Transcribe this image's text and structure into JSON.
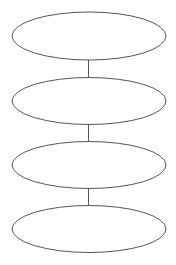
{
  "diagram": {
    "type": "vertical-chain",
    "stroke_color": "#555555",
    "fill_color": "#ffffff",
    "background": "#ffffff",
    "nodes": [
      {
        "id": "node-1",
        "label": "",
        "cx": 89,
        "cy": 36,
        "rx": 77,
        "ry": 24
      },
      {
        "id": "node-2",
        "label": "",
        "cx": 89,
        "cy": 101,
        "rx": 77,
        "ry": 23.5
      },
      {
        "id": "node-3",
        "label": "",
        "cx": 89,
        "cy": 165,
        "rx": 77,
        "ry": 23.5
      },
      {
        "id": "node-4",
        "label": "",
        "cx": 89,
        "cy": 229,
        "rx": 77,
        "ry": 23.5
      }
    ],
    "edges": [
      {
        "from": "node-1",
        "to": "node-2",
        "x": 88.5,
        "y1": 60,
        "y2": 77.5
      },
      {
        "from": "node-2",
        "to": "node-3",
        "x": 88.5,
        "y1": 124.5,
        "y2": 141.5
      },
      {
        "from": "node-3",
        "to": "node-4",
        "x": 88.5,
        "y1": 188.5,
        "y2": 205.5
      }
    ]
  }
}
